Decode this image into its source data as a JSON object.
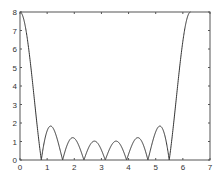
{
  "chart_data": {
    "type": "line",
    "title": "",
    "xlabel": "",
    "ylabel": "",
    "xlim": [
      0,
      7
    ],
    "ylim": [
      0,
      8
    ],
    "grid": false,
    "legend": null,
    "x_ticks": [
      "0",
      "1",
      "2",
      "3",
      "4",
      "5",
      "6",
      "7"
    ],
    "y_ticks": [
      "0",
      "1",
      "2",
      "3",
      "4",
      "5",
      "6",
      "7",
      "8"
    ],
    "series": [
      {
        "name": "|sin(4x)/sin(x/2)|",
        "color": "#333333",
        "x_range": [
          0,
          6.2832
        ],
        "description": "Magnitude of Dirichlet kernel N=8; peak 8 at x=0 and x=2π, zeros near 0.785,1.571,2.356,3.142,3.927,4.712,5.498",
        "sample_points": [
          {
            "x": 0,
            "y": 8
          },
          {
            "x": 0.785,
            "y": 0
          },
          {
            "x": 1.15,
            "y": 1.8
          },
          {
            "x": 1.571,
            "y": 0
          },
          {
            "x": 1.95,
            "y": 1.2
          },
          {
            "x": 2.356,
            "y": 0
          },
          {
            "x": 2.75,
            "y": 1.0
          },
          {
            "x": 3.142,
            "y": 0
          },
          {
            "x": 3.53,
            "y": 1.0
          },
          {
            "x": 3.927,
            "y": 0
          },
          {
            "x": 4.33,
            "y": 1.2
          },
          {
            "x": 4.712,
            "y": 0
          },
          {
            "x": 5.13,
            "y": 1.8
          },
          {
            "x": 5.498,
            "y": 0
          },
          {
            "x": 6.2832,
            "y": 8
          }
        ]
      }
    ]
  }
}
